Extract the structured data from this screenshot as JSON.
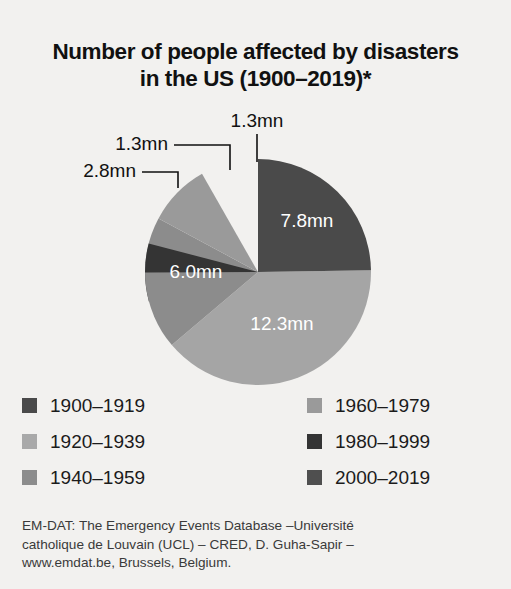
{
  "title": {
    "line1": "Number of people affected by disasters",
    "line2": "in the US (1900–2019)*"
  },
  "chart_data": {
    "type": "pie",
    "title": "Number of people affected by disasters in the US (1900–2019)*",
    "unit": "mn",
    "total": 31.5,
    "legend_position": "bottom",
    "grid": false,
    "categories": [
      "1900–1919",
      "1920–1939",
      "1940–1959",
      "1960–1979",
      "1980–1999",
      "2000–2019"
    ],
    "values": [
      1.3,
      12.3,
      6.0,
      2.8,
      1.3,
      7.8
    ],
    "colors": [
      "#3f3f3f",
      "#a5a5a5",
      "#8c8c8c",
      "#9a9a9a",
      "#343434",
      "#4a4a4a"
    ],
    "slices": [
      {
        "label": "1900–1919",
        "value": 1.3,
        "value_label": "1.3mn",
        "color": "#3f3f3f",
        "label_placement": "callout",
        "callout_text_x": 168,
        "callout_text_y": 35,
        "leader_path": "M 174 35 L 230 35 L 230 60",
        "start_angle": 254.9,
        "end_angle": 269.7
      },
      {
        "label": "1920–1939",
        "value": 12.3,
        "value_label": "12.3mn",
        "color": "#a5a5a5",
        "label_placement": "inside",
        "label_x": 282,
        "label_y": 215,
        "start_angle": 89.1,
        "end_angle": 229.7
      },
      {
        "label": "1940–1959",
        "value": 6.0,
        "value_label": "6.0mn",
        "color": "#8c8c8c",
        "label_placement": "inside",
        "label_x": 196,
        "label_y": 163,
        "start_angle": 229.7,
        "end_angle": 298.3
      },
      {
        "label": "1960–1979",
        "value": 2.8,
        "value_label": "2.8mn",
        "color": "#9a9a9a",
        "label_placement": "callout",
        "callout_text_x": 136,
        "callout_text_y": 62,
        "leader_path": "M 142 62 L 178 62 L 178 78",
        "start_angle": 298.3,
        "end_angle": 330.3
      },
      {
        "label": "1980–1999",
        "value": 1.3,
        "value_label": "1.3mn",
        "color": "#343434",
        "label_placement": "callout",
        "callout_text_x": 257,
        "callout_text_y": 12,
        "leader_path": "M 257 24 L 257 52",
        "start_angle": 269.7,
        "end_angle": 284.6
      },
      {
        "label": "2000–2019",
        "value": 7.8,
        "value_label": "7.8mn",
        "color": "#4a4a4a",
        "label_placement": "inside",
        "label_x": 307,
        "label_y": 112,
        "start_angle": 0.0,
        "end_angle": 89.1
      }
    ]
  },
  "legend": {
    "items": [
      {
        "label": "1900–1919",
        "color": "#4a4a4a",
        "column": "left",
        "row": 0
      },
      {
        "label": "1920–1939",
        "color": "#a9a9a9",
        "column": "left",
        "row": 1
      },
      {
        "label": "1940–1959",
        "color": "#8c8c8c",
        "column": "left",
        "row": 2
      },
      {
        "label": "1960–1979",
        "color": "#9a9a9a",
        "column": "right",
        "row": 0
      },
      {
        "label": "1980–1999",
        "color": "#343434",
        "column": "right",
        "row": 1
      },
      {
        "label": "2000–2019",
        "color": "#4f4f4f",
        "column": "right",
        "row": 2
      }
    ]
  },
  "source": {
    "line1": "EM-DAT: The Emergency Events Database –Université",
    "line2": "catholique de Louvain (UCL) – CRED, D. Guha-Sapir –",
    "line3": "www.emdat.be, Brussels, Belgium."
  }
}
